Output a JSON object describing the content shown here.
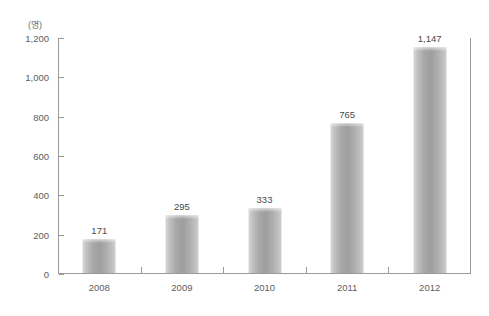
{
  "chart_data": {
    "type": "bar",
    "title": "",
    "subtitle": "",
    "unit_label": "(명)",
    "xlabel": "",
    "ylabel": "",
    "categories": [
      "2008",
      "2009",
      "2010",
      "2011",
      "2012"
    ],
    "values": [
      171,
      295,
      333,
      765,
      1147
    ],
    "value_labels": [
      "171",
      "295",
      "333",
      "765",
      "1,147"
    ],
    "ylim": [
      0,
      1200
    ],
    "ytick_values": [
      0,
      200,
      400,
      600,
      800,
      1000,
      1200
    ],
    "ytick_labels": [
      "0",
      "200",
      "400",
      "600",
      "800",
      "1,000",
      "1,200"
    ],
    "grid": false,
    "legend": null,
    "series": [
      {
        "name": "",
        "values": [
          171,
          295,
          333,
          765,
          1147
        ]
      }
    ],
    "colors": {
      "bar_light": "#d8d8d8",
      "bar_mid": "#a8a8a8",
      "bar_dark": "#9e9e9e",
      "axis": "#9a9a9a",
      "tick_text": "#5d5d5d",
      "value_text": "#4a4a4a",
      "background": "#ffffff"
    }
  }
}
